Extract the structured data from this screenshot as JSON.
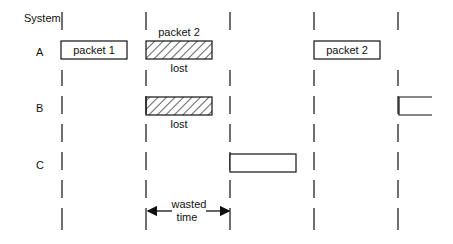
{
  "header_label": "System",
  "rows": [
    {
      "name": "A"
    },
    {
      "name": "B"
    },
    {
      "name": "C"
    }
  ],
  "packets": {
    "a_packet1": "packet 1",
    "a_packet2_above": "packet 2",
    "a_lost": "lost",
    "a_packet2_retry": "packet 2",
    "b_lost": "lost"
  },
  "annotation": {
    "line1": "wasted",
    "line2": "time"
  },
  "colors": {
    "ink": "#111111",
    "background": "#ffffff"
  }
}
